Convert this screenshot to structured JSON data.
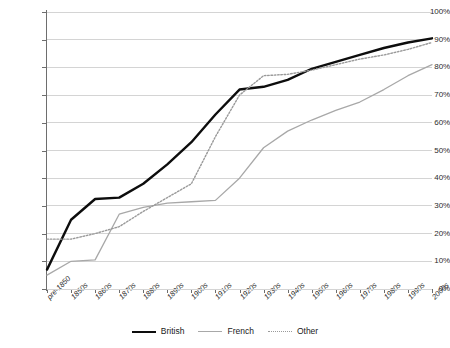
{
  "chart_data": {
    "type": "line",
    "title": "",
    "xlabel": "",
    "ylabel": "",
    "ylim": [
      0,
      100
    ],
    "grid": true,
    "legend_position": "bottom",
    "y_tick_labels": [
      "100%",
      "90%",
      "80%",
      "70%",
      "60%",
      "50%",
      "40%",
      "30%",
      "20%",
      "10%",
      "0%"
    ],
    "y_tick_values": [
      100,
      90,
      80,
      70,
      60,
      50,
      40,
      30,
      20,
      10,
      0
    ],
    "categories": [
      "pre-1850",
      "1850s",
      "1860s",
      "1870s",
      "1880s",
      "1890s",
      "1900s",
      "1910s",
      "1920s",
      "1930s",
      "1940s",
      "1950s",
      "1960s",
      "1970s",
      "1980s",
      "1990s",
      "2000s"
    ],
    "series": [
      {
        "name": "British",
        "color": "#0d0d0d",
        "style": "solid",
        "width": 2.4,
        "values": [
          7,
          25,
          32.5,
          33,
          38,
          45,
          53,
          63,
          72,
          73,
          75.5,
          79.5,
          82,
          84.5,
          87,
          89,
          90.5
        ]
      },
      {
        "name": "French",
        "color": "#a8a8a8",
        "style": "solid",
        "width": 1.3,
        "values": [
          5,
          10,
          10.5,
          27,
          29.5,
          31,
          31.5,
          32,
          40,
          51,
          57,
          61,
          64.5,
          67.5,
          72,
          77,
          81
        ]
      },
      {
        "name": "Other",
        "color": "#9a9a9a",
        "style": "dotted",
        "width": 1.4,
        "values": [
          18,
          18,
          20,
          22.5,
          28,
          33,
          38,
          55,
          70,
          77,
          77.5,
          79,
          81,
          83,
          84.5,
          86.5,
          89
        ]
      }
    ]
  },
  "legend": {
    "items": [
      {
        "label": "British"
      },
      {
        "label": "French"
      },
      {
        "label": "Other"
      }
    ]
  }
}
